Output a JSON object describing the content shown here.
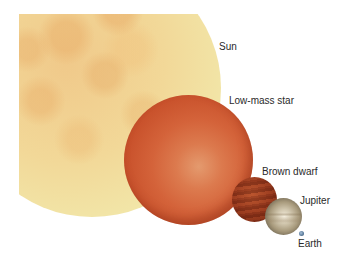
{
  "figure": {
    "title": "",
    "bodies": [
      {
        "name": "Sun",
        "label": "Sun",
        "color": "#f2d898"
      },
      {
        "name": "Low-mass star",
        "label": "Low-mass star",
        "color": "#d4633a"
      },
      {
        "name": "Brown dwarf",
        "label": "Brown dwarf",
        "color": "#96391d"
      },
      {
        "name": "Jupiter",
        "label": "Jupiter",
        "color": "#a89a7c"
      },
      {
        "name": "Earth",
        "label": "Earth",
        "color": "#5a7a9a"
      }
    ]
  }
}
